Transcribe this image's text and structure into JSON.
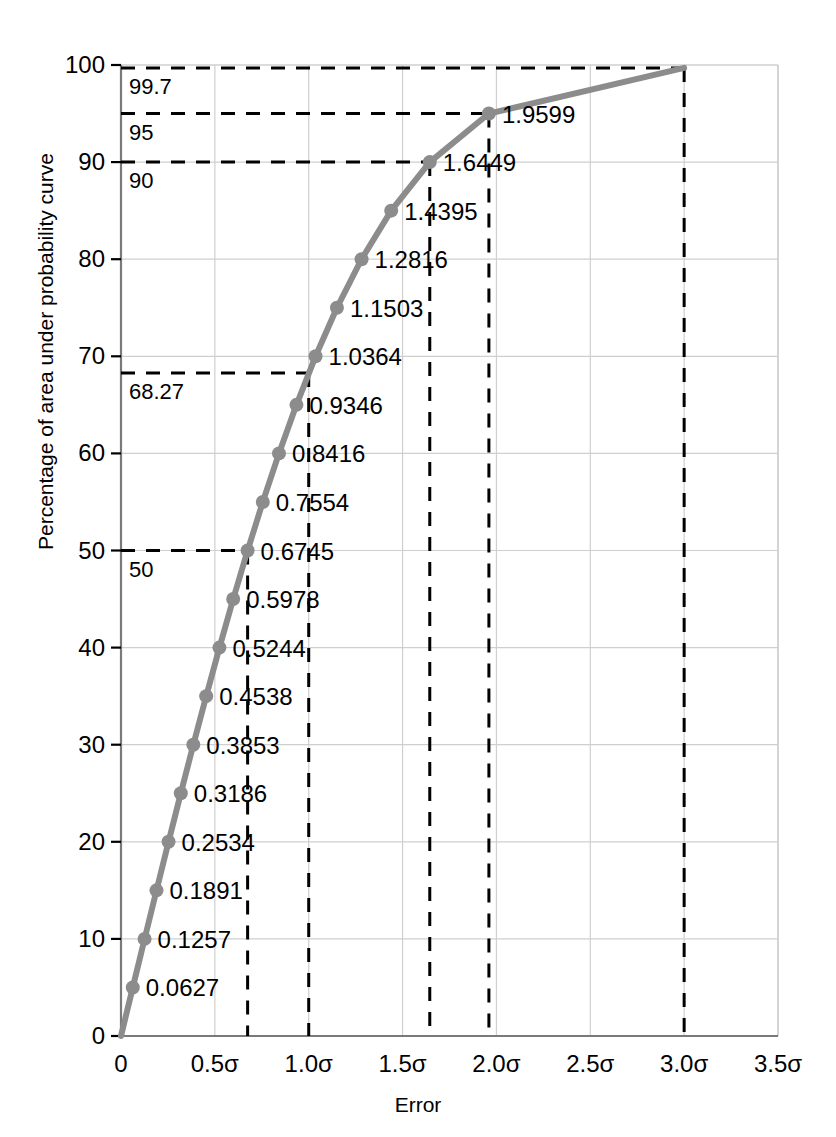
{
  "chart_data": {
    "type": "line",
    "title": "",
    "xlabel": "Error",
    "ylabel": "Percentage of area under probability curve",
    "xlim": [
      0,
      3.5
    ],
    "ylim": [
      0,
      100
    ],
    "grid": true,
    "legend": "none",
    "x_tick_labels": [
      "0",
      "0.5σ",
      "1.0σ",
      "1.5σ",
      "2.0σ",
      "2.5σ",
      "3.0σ",
      "3.5σ"
    ],
    "x_tick_values": [
      0,
      0.5,
      1.0,
      1.5,
      2.0,
      2.5,
      3.0,
      3.5
    ],
    "y_tick_labels": [
      "0",
      "10",
      "20",
      "30",
      "40",
      "50",
      "60",
      "70",
      "80",
      "90",
      "100"
    ],
    "y_tick_values": [
      0,
      10,
      20,
      30,
      40,
      50,
      60,
      70,
      80,
      90,
      100
    ],
    "series": [
      {
        "name": "Cumulative normal (two-sided) percentage of area",
        "points": [
          {
            "x": 0.0,
            "y": 0,
            "label": ""
          },
          {
            "x": 0.0627,
            "y": 5,
            "label": "0.0627"
          },
          {
            "x": 0.1257,
            "y": 10,
            "label": "0.1257"
          },
          {
            "x": 0.1891,
            "y": 15,
            "label": "0.1891"
          },
          {
            "x": 0.2534,
            "y": 20,
            "label": "0.2534"
          },
          {
            "x": 0.3186,
            "y": 25,
            "label": "0.3186"
          },
          {
            "x": 0.3853,
            "y": 30,
            "label": "0.3853"
          },
          {
            "x": 0.4538,
            "y": 35,
            "label": "0.4538"
          },
          {
            "x": 0.5244,
            "y": 40,
            "label": "0.5244"
          },
          {
            "x": 0.5978,
            "y": 45,
            "label": "0.5978"
          },
          {
            "x": 0.6745,
            "y": 50,
            "label": "0.6745"
          },
          {
            "x": 0.7554,
            "y": 55,
            "label": "0.7554"
          },
          {
            "x": 0.8416,
            "y": 60,
            "label": "0.8416"
          },
          {
            "x": 0.9346,
            "y": 65,
            "label": "0.9346"
          },
          {
            "x": 1.0364,
            "y": 70,
            "label": "1.0364"
          },
          {
            "x": 1.1503,
            "y": 75,
            "label": "1.1503"
          },
          {
            "x": 1.2816,
            "y": 80,
            "label": "1.2816"
          },
          {
            "x": 1.4395,
            "y": 85,
            "label": "1.4395"
          },
          {
            "x": 1.6449,
            "y": 90,
            "label": "1.6449"
          },
          {
            "x": 1.9599,
            "y": 95,
            "label": "1.9599"
          },
          {
            "x": 3.0,
            "y": 99.7,
            "label": ""
          }
        ]
      }
    ],
    "reference_lines": [
      {
        "label": "50",
        "y": 50,
        "x_end": 0.6745
      },
      {
        "label": "68.27",
        "y": 68.27,
        "x_end": 1.0
      },
      {
        "label": "90",
        "y": 90,
        "x_end": 1.6449
      },
      {
        "label": "95",
        "y": 95,
        "x_end": 1.9599
      },
      {
        "label": "99.7",
        "y": 99.7,
        "x_end": 3.0
      }
    ],
    "vertical_drop_lines": [
      {
        "x": 0.6745,
        "y_top": 50
      },
      {
        "x": 1.0,
        "y_top": 68.27
      },
      {
        "x": 1.6449,
        "y_top": 90
      },
      {
        "x": 1.9599,
        "y_top": 95
      },
      {
        "x": 3.0,
        "y_top": 99.7
      }
    ],
    "colors": {
      "curve": "#8c8c8c",
      "marker": "#8c8c8c",
      "grid": "#cfcfcf",
      "axis": "#7a7a7a",
      "dashed": "#000000",
      "text": "#000000",
      "background": "#ffffff"
    }
  }
}
